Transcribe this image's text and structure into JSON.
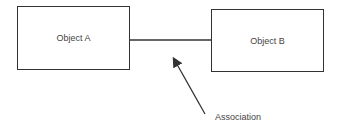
{
  "diagram": {
    "object_a": {
      "label": "Object A"
    },
    "object_b": {
      "label": "Object B"
    },
    "connector": {
      "type": "association line"
    },
    "annotation": {
      "label": "Association"
    }
  }
}
